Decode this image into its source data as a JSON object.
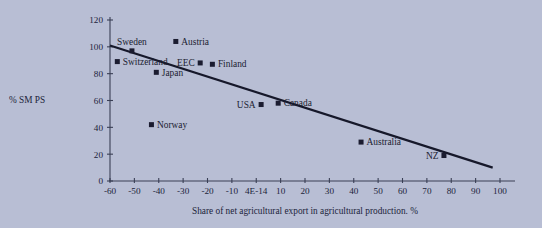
{
  "chart_data": {
    "type": "scatter",
    "title": "",
    "xlabel": "Share of net agricultural export in agricultural production. %",
    "ylabel": "% SM PS",
    "xlim": [
      -60,
      100
    ],
    "ylim": [
      0,
      120
    ],
    "grid": false,
    "legend": "none",
    "xticks": [
      "-60",
      "-50",
      "-40",
      "-30",
      "-20",
      "-10",
      "4E-14",
      "10",
      "20",
      "30",
      "40",
      "50",
      "60",
      "70",
      "80",
      "90",
      "100"
    ],
    "xtick_values": [
      -60,
      -50,
      -40,
      -30,
      -20,
      -10,
      0,
      10,
      20,
      30,
      40,
      50,
      60,
      70,
      80,
      90,
      100
    ],
    "yticks": [
      "0",
      "20",
      "40",
      "60",
      "80",
      "100",
      "120"
    ],
    "ytick_values": [
      0,
      20,
      40,
      60,
      80,
      100,
      120
    ],
    "points": [
      {
        "name": "Switzerland",
        "x": -57,
        "y": 89,
        "label_pos": "right"
      },
      {
        "name": "Sweden",
        "x": -51,
        "y": 97,
        "label_pos": "above"
      },
      {
        "name": "Norway",
        "x": -43,
        "y": 42,
        "label_pos": "right"
      },
      {
        "name": "Japan",
        "x": -41,
        "y": 81,
        "label_pos": "right"
      },
      {
        "name": "Austria",
        "x": -33,
        "y": 104,
        "label_pos": "right"
      },
      {
        "name": "EEC",
        "x": -23,
        "y": 88,
        "label_pos": "left"
      },
      {
        "name": "Finland",
        "x": -18,
        "y": 87,
        "label_pos": "right"
      },
      {
        "name": "USA",
        "x": 2,
        "y": 57,
        "label_pos": "left"
      },
      {
        "name": "Canada",
        "x": 9,
        "y": 58,
        "label_pos": "right"
      },
      {
        "name": "Australia",
        "x": 43,
        "y": 29,
        "label_pos": "right"
      },
      {
        "name": "NZ",
        "x": 77,
        "y": 19,
        "label_pos": "left"
      }
    ],
    "trendline": {
      "x_start": -60,
      "y_start": 101,
      "x_end": 97,
      "y_end": 10
    },
    "colors": {
      "background": "#b8bed4",
      "marker": "#1b1c30",
      "axis": "#3a3f55",
      "trend": "#16182a",
      "text": "#20233a"
    }
  }
}
